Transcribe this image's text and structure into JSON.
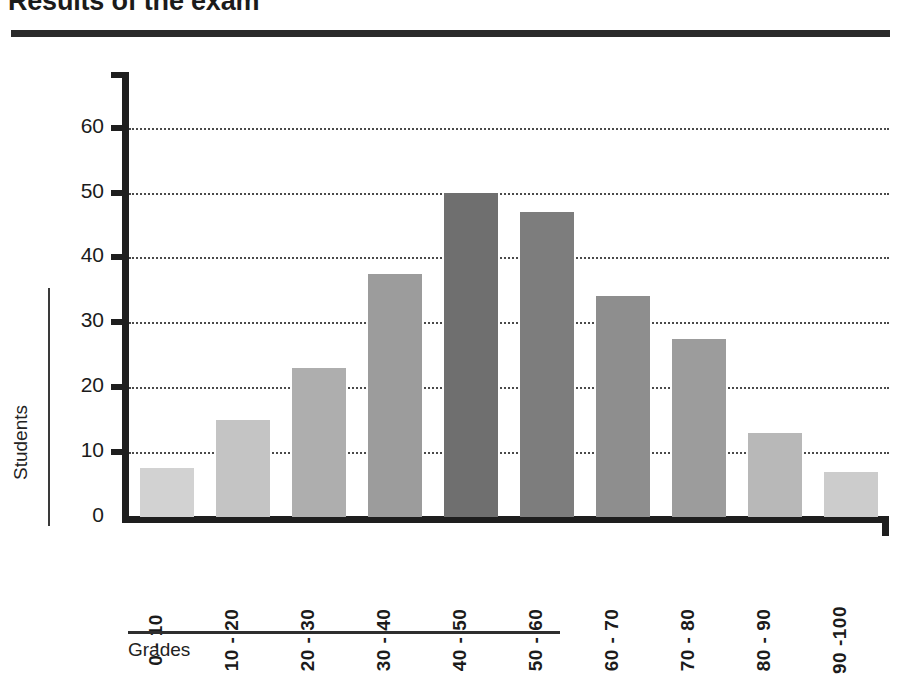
{
  "title": "Results of the exam",
  "axes": {
    "y_title": "Students",
    "x_title": "Grades"
  },
  "chart_data": {
    "type": "bar",
    "title": "Results of the exam",
    "xlabel": "Grades",
    "ylabel": "Students",
    "ylim": [
      0,
      65
    ],
    "yticks": [
      0,
      10,
      20,
      30,
      40,
      50,
      60
    ],
    "ytick_labels": [
      "0",
      "10",
      "20",
      "30",
      "40",
      "50",
      "60"
    ],
    "grid": "horizontal-dotted",
    "legend": "none",
    "categories": [
      "0 - 10",
      "10 - 20",
      "20 - 30",
      "30 - 40",
      "40 - 50",
      "50 - 60",
      "60 - 70",
      "70 - 80",
      "80 - 90",
      "90 -100"
    ],
    "values": [
      7.5,
      15,
      23,
      37.5,
      50,
      47,
      34,
      27.5,
      13,
      7
    ],
    "bar_colors": [
      "#d2d2d2",
      "#c4c4c4",
      "#aeaeae",
      "#9c9c9c",
      "#6f6f6f",
      "#7d7d7d",
      "#8e8e8e",
      "#9c9c9c",
      "#b8b8b8",
      "#cccccc"
    ]
  }
}
